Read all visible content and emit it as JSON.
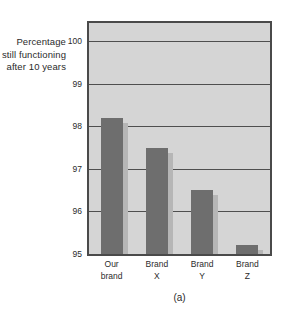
{
  "figure": {
    "caption": "(a)",
    "ylabel_lines": [
      "Percentage",
      "still functioning",
      "after 10 years"
    ],
    "colors": {
      "plot_background": "#d5d5d5",
      "plot_border": "#4a4a4a",
      "gridline": "#4f4f4f",
      "bar_fill": "#6e6e6e",
      "bar_shadow": "#b6b6b6",
      "text": "#2b2b2b",
      "page_background": "#ffffff"
    }
  },
  "chart_data": {
    "type": "bar",
    "title": "",
    "subtitle": "",
    "caption": "(a)",
    "categories": [
      "Our brand",
      "Brand X",
      "Brand Y",
      "Brand Z"
    ],
    "category_lines": [
      [
        "Our",
        "brand"
      ],
      [
        "Brand",
        "X"
      ],
      [
        "Brand",
        "Y"
      ],
      [
        "Brand",
        "Z"
      ]
    ],
    "values": [
      98.2,
      97.5,
      96.5,
      95.2
    ],
    "xlabel": "",
    "ylabel": "Percentage still functioning after 10 years",
    "ylim": [
      95,
      100
    ],
    "yticks": [
      100,
      99,
      98,
      97,
      96,
      95
    ],
    "ytick_labels": [
      "100",
      "99",
      "98",
      "97",
      "96",
      "95"
    ],
    "grid": true,
    "grid_axis": "y",
    "legend": false,
    "legend_position": "none",
    "bar_count": 4
  }
}
